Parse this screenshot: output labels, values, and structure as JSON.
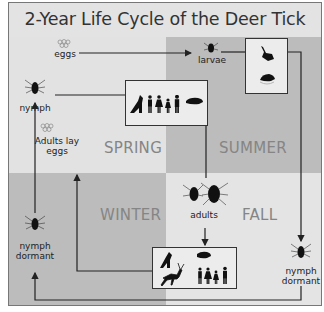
{
  "title": "2-Year Life Cycle of the Deer Tick",
  "seasons": {
    "spring": "SPRING",
    "summer": "SUMMER",
    "winter": "WINTER",
    "fall": "FALL"
  },
  "stages": {
    "eggs": "eggs",
    "larvae": "larvae",
    "nymph": "nymph",
    "adults_lay_eggs_1": "Adults lay",
    "adults_lay_eggs_2": "eggs",
    "adults": "adults",
    "nymph_dormant_left_1": "nymph",
    "nymph_dormant_left_2": "dormant",
    "nymph_dormant_right_1": "nymph",
    "nymph_dormant_right_2": "dormant"
  },
  "hosts": {
    "larvae_hosts": [
      "bird-icon",
      "mouse-icon"
    ],
    "nymph_hosts": [
      "dog-icon",
      "man-icon",
      "woman-icon",
      "girl-icon",
      "man-icon",
      "mouse-icon"
    ],
    "adult_hosts": [
      "dog-icon",
      "mouse-icon",
      "deer-icon",
      "man-icon",
      "woman-icon",
      "girl-icon",
      "man-icon"
    ]
  },
  "colors": {
    "light_quadrant": "#e2e2e2",
    "dark_quadrant": "#bcbcbc",
    "season_text": "#858585",
    "line": "#222222"
  }
}
